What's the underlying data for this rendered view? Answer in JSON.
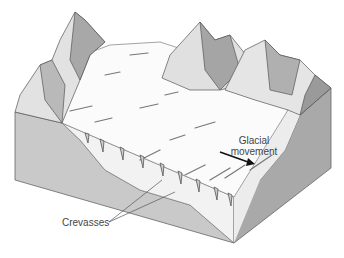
{
  "figure": {
    "labels": {
      "glacial_movement_line1": "Glacial",
      "glacial_movement_line2": "movement",
      "crevasses": "Crevasses"
    },
    "colors": {
      "ice": "#fbfbfb",
      "front_face": "#c9c9c9",
      "side_face": "#a9a9a9",
      "rock_light": "#e2e2e2",
      "rock_dark": "#9a9a9a",
      "outline": "#555555"
    }
  }
}
